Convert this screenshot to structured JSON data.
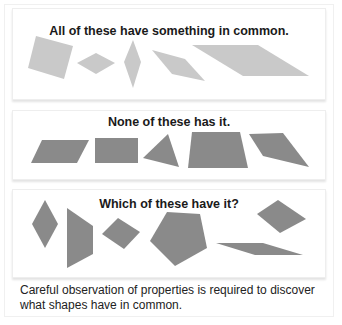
{
  "colors": {
    "set1_fill": "#c9c9c9",
    "set2_fill": "#8a8a8a",
    "set3_fill": "#8a8a8a"
  },
  "panels": [
    {
      "title": "All of these have something in common.",
      "shapes": [
        {
          "name": "tilted-square",
          "points": "36,36 73,46 64,79 28,68"
        },
        {
          "name": "small-rhombus",
          "points": "77,63 96,53 115,63 96,74"
        },
        {
          "name": "tall-thin-rhombus",
          "points": "133,40 141,62 133,88 124,62"
        },
        {
          "name": "slanted-rhombus",
          "points": "152,50 185,59 205,81 172,74"
        },
        {
          "name": "long-parallelogram",
          "points": "192,45 258,45 309,76 243,76"
        }
      ]
    },
    {
      "title": "None of these has it.",
      "shapes": [
        {
          "name": "parallelogram",
          "points": "42,140 89,140 77,163 31,163"
        },
        {
          "name": "rectangle",
          "points": "95,138 138,138 138,163 95,163"
        },
        {
          "name": "triangle",
          "points": "168,134 179,167 143,158"
        },
        {
          "name": "trapezoid",
          "points": "192,132 240,132 248,168 188,168"
        },
        {
          "name": "irregular-quadrilateral",
          "points": "249,134 283,133 309,167 263,156"
        }
      ]
    },
    {
      "title": "Which of these have it?",
      "shapes": [
        {
          "name": "vertical-rhombus",
          "points": "45,200 58,224 45,248 32,224"
        },
        {
          "name": "tall-trapezoid",
          "points": "67,208 93,226 93,254 67,268"
        },
        {
          "name": "tilted-square",
          "points": "102,234 118,218 140,232 124,249"
        },
        {
          "name": "pentagon",
          "points": "167,212 200,214 207,248 175,266 150,241"
        },
        {
          "name": "flat-parallelogram",
          "points": "216,243 263,243 303,255 255,255"
        },
        {
          "name": "rhombus",
          "points": "257,214 278,200 306,219 280,233"
        }
      ]
    }
  ],
  "caption": "Careful observation of properties is required to discover what shapes have in common."
}
